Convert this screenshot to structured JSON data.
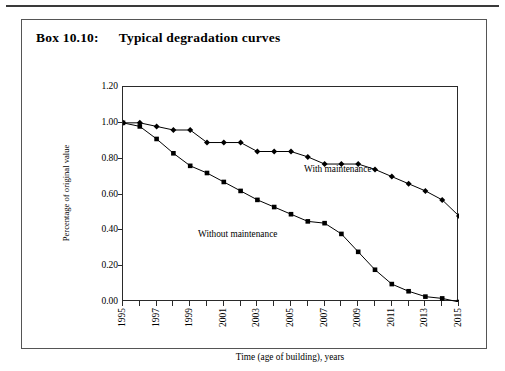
{
  "box": {
    "number": "Box 10.10:",
    "title": "Typical degradation curves"
  },
  "chart_data": {
    "type": "line",
    "title": "Typical degradation curves",
    "xlabel": "Time (age of building), years",
    "ylabel": "Percentage of original value",
    "xlim": [
      1995,
      2015
    ],
    "ylim": [
      0.0,
      1.2
    ],
    "ytick_labels": [
      "0.00",
      "0.20",
      "0.40",
      "0.60",
      "0.80",
      "1.00",
      "1.20"
    ],
    "ytick_values": [
      0.0,
      0.2,
      0.4,
      0.6,
      0.8,
      1.0,
      1.2
    ],
    "xtick_labels": [
      "1995",
      "1997",
      "1999",
      "2001",
      "2003",
      "2005",
      "2007",
      "2009",
      "2011",
      "2013",
      "2015"
    ],
    "xtick_values": [
      1995,
      1997,
      1999,
      2001,
      2003,
      2005,
      2007,
      2009,
      2011,
      2013,
      2015
    ],
    "x": [
      1995,
      1996,
      1997,
      1998,
      1999,
      2000,
      2001,
      2002,
      2003,
      2004,
      2005,
      2006,
      2007,
      2008,
      2009,
      2010,
      2011,
      2012,
      2013,
      2014,
      2015
    ],
    "grid": false,
    "legend": "inline-annotations",
    "series": [
      {
        "name": "With maintenance",
        "marker": "diamond",
        "values": [
          1.0,
          1.0,
          0.98,
          0.96,
          0.96,
          0.89,
          0.89,
          0.89,
          0.84,
          0.84,
          0.84,
          0.81,
          0.77,
          0.77,
          0.77,
          0.74,
          0.7,
          0.66,
          0.62,
          0.57,
          0.48
        ]
      },
      {
        "name": "Without maintenance",
        "marker": "square",
        "values": [
          1.0,
          0.98,
          0.91,
          0.83,
          0.76,
          0.72,
          0.67,
          0.62,
          0.57,
          0.53,
          0.49,
          0.45,
          0.44,
          0.38,
          0.28,
          0.18,
          0.1,
          0.06,
          0.03,
          0.02,
          0.0
        ]
      }
    ],
    "annotations": [
      {
        "text": "With maintenance",
        "x": 2007,
        "y": 0.86
      },
      {
        "text": "Without maintenance",
        "x": 2001,
        "y": 0.48
      }
    ],
    "colors": {
      "line": "#000000",
      "marker": "#000000",
      "axis": "#2a2a2a"
    }
  }
}
